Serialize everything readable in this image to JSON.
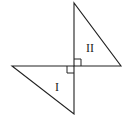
{
  "diagram": {
    "triangles": [
      {
        "label": "II",
        "vertices": [
          [
            74,
            3
          ],
          [
            74,
            66
          ],
          [
            121,
            66
          ]
        ],
        "right_angle_at": [
          74,
          66
        ],
        "label_pos": [
          92,
          52
        ]
      },
      {
        "label": "I",
        "vertices": [
          [
            12,
            66
          ],
          [
            74,
            66
          ],
          [
            74,
            114
          ]
        ],
        "right_angle_at": [
          74,
          66
        ],
        "label_pos": [
          55,
          90
        ]
      }
    ],
    "label_I": "I",
    "label_II": "II",
    "stroke_color": "#222222"
  }
}
